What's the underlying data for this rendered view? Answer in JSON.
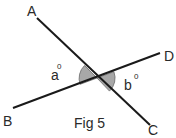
{
  "figure": {
    "caption": "Fig 5",
    "colors": {
      "line": "#1a1a1a",
      "angle_fill": "#a8a8a8",
      "angle_stroke": "#6a6a6a",
      "text": "#2a2a2a"
    },
    "points": {
      "A": {
        "label": "A",
        "x": 37,
        "y": 18
      },
      "B": {
        "label": "B",
        "x": 13,
        "y": 108
      },
      "C": {
        "label": "C",
        "x": 150,
        "y": 125
      },
      "D": {
        "label": "D",
        "x": 160,
        "y": 53
      },
      "O": {
        "x": 97,
        "y": 78
      }
    },
    "lines": [
      {
        "name": "AC",
        "from": "A",
        "to": "C"
      },
      {
        "name": "BD",
        "from": "B",
        "to": "D"
      }
    ],
    "angles": {
      "a": {
        "label": "a",
        "superscript": "0"
      },
      "b": {
        "label": "b",
        "superscript": "0"
      }
    }
  }
}
